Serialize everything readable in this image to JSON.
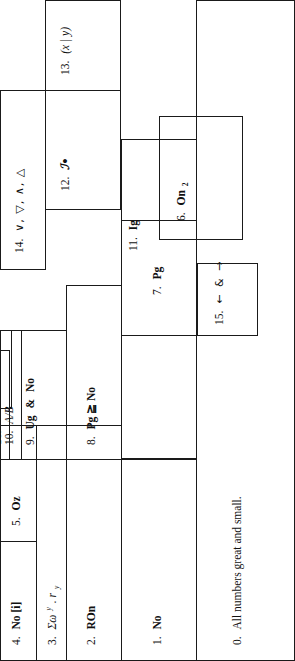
{
  "figure": {
    "type": "nested-hierarchy-diagram",
    "orientation": "rotated-90-ccw",
    "stroke_color": "#1a1a1a",
    "background_color": "#ffffff"
  },
  "nodes": [
    {
      "id": "0",
      "num": "0.",
      "text": "All numbers great and small."
    },
    {
      "id": "1",
      "num": "1.",
      "text": "No"
    },
    {
      "id": "2",
      "num": "2.",
      "text": "ROn"
    },
    {
      "id": "3",
      "num": "3.",
      "text": "Σωʸ . rᵧ"
    },
    {
      "id": "4",
      "num": "4.",
      "text": "No [i]"
    },
    {
      "id": "5",
      "num": "5.",
      "text": "Oz"
    },
    {
      "id": "6",
      "num": "6.",
      "text": "On₂"
    },
    {
      "id": "7",
      "num": "7.",
      "text": "Pg"
    },
    {
      "id": "8",
      "num": "8.",
      "text": "Pg ≧ No"
    },
    {
      "id": "9",
      "num": "9.",
      "text": "Ug & No"
    },
    {
      "id": "10",
      "num": "10.",
      "text": "A/B"
    },
    {
      "id": "11",
      "num": "11.",
      "text": "Ig"
    },
    {
      "id": "12",
      "num": "12.",
      "text": "ℐ•"
    },
    {
      "id": "13",
      "num": "13.",
      "text": "(x | y)"
    },
    {
      "id": "14",
      "num": "14.",
      "text": "∨, ▽, ∧, △"
    },
    {
      "id": "15",
      "num": "15.",
      "text": "← & →"
    },
    {
      "id": "16",
      "num": "16.",
      "text": "∞"
    }
  ],
  "labels": {
    "n0_num": "0.",
    "n0_text": "All numbers great and small.",
    "n1_num": "1.",
    "n1_text": "No",
    "n2_num": "2.",
    "n2_text": "ROn",
    "n3_num": "3.",
    "n3_text": "Σω",
    "n3_sup": "y",
    "n3_tail": ". r",
    "n3_sub": "y",
    "n4_num": "4.",
    "n4_text": "No [i]",
    "n5_num": "5.",
    "n5_text": "Oz",
    "n6_num": "6.",
    "n6_text": "On",
    "n6_sub": "2",
    "n7_num": "7.",
    "n7_text": "Pg",
    "n8_num": "8.",
    "n8_text": "Pg ≧ No",
    "n9_num": "9.",
    "n9_line1": "Ug",
    "n9_line2": "&",
    "n9_line3": "No",
    "n10_num": "10.",
    "n10_text": "A/B",
    "n11_num": "11.",
    "n11_text": "Ig",
    "n12_num": "12.",
    "n12_text": "ℐ•",
    "n13_num": "13.",
    "n13_text": "(x | y)",
    "n14_num": "14.",
    "n14_text": "∨, ▽, ∧, △",
    "n15_num": "15.",
    "n15_text": "← & →",
    "n16_num": "16.",
    "n16_text": "∞"
  }
}
